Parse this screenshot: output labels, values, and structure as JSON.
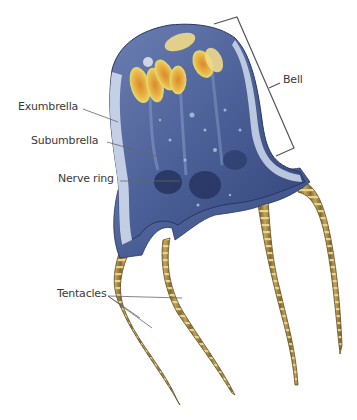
{
  "diagram": {
    "labels": {
      "bell": "Bell",
      "exumbrella": "Exumbrella",
      "subumbrella": "Subumbrella",
      "nerve_ring": "Nerve ring",
      "tentacles": "Tentacles"
    },
    "colors": {
      "bell_body": "#4a5f96",
      "bell_dark": "#2b3a6e",
      "exumbrella_edge": "#c9d6ea",
      "gonads": "#e9b84a",
      "gonad_glow": "#f3e28a",
      "tentacle": "#b89a4e",
      "tentacle_band": "#e6cf86",
      "leader_line": "#555555",
      "label_text": "#3a3a3a"
    }
  }
}
